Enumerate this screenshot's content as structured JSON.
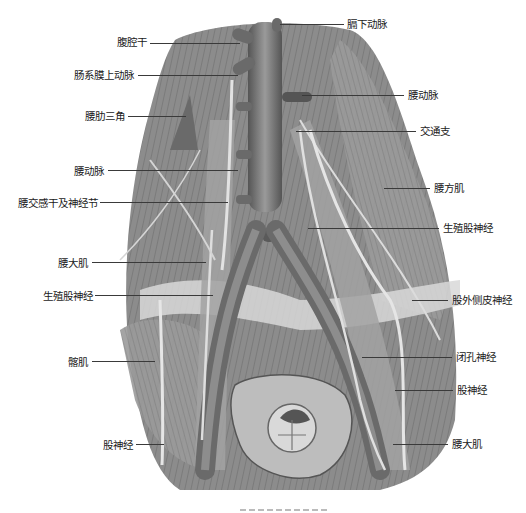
{
  "figure": {
    "type": "anatomical-illustration",
    "style": "grayscale pencil drawing",
    "colors": {
      "background": "#ffffff",
      "muscle": "#8a8a8a",
      "vessel": "#6e6e6e",
      "nerve": "#d8d8d8",
      "text": "#1a1a1a"
    }
  },
  "labels": {
    "left": [
      {
        "id": "celiac-trunk",
        "text": "腹腔干"
      },
      {
        "id": "superior-mesenteric-artery",
        "text": "肠系膜上动脉"
      },
      {
        "id": "lumbocostal-triangle",
        "text": "腰肋三角"
      },
      {
        "id": "lumbar-artery",
        "text": "腰动脉"
      },
      {
        "id": "lumbar-sympathetic-trunk",
        "text": "腰交感干及神经节"
      },
      {
        "id": "psoas-major-left",
        "text": "腰大肌"
      },
      {
        "id": "genitofemoral-nerve-left",
        "text": "生殖股神经"
      },
      {
        "id": "iliacus",
        "text": "髂肌"
      },
      {
        "id": "femoral-nerve-left",
        "text": "股神经"
      }
    ],
    "right": [
      {
        "id": "inferior-phrenic-artery",
        "text": "膈下动脉"
      },
      {
        "id": "lumbar-artery-right",
        "text": "腰动脉"
      },
      {
        "id": "communicating-branch",
        "text": "交通支"
      },
      {
        "id": "quadratus-lumborum",
        "text": "腰方肌"
      },
      {
        "id": "genitofemoral-nerve-right",
        "text": "生殖股神经"
      },
      {
        "id": "lateral-femoral-cutaneous-nerve",
        "text": "股外侧皮神经"
      },
      {
        "id": "obturator-nerve",
        "text": "闭孔神经"
      },
      {
        "id": "femoral-nerve-right",
        "text": "股神经"
      },
      {
        "id": "psoas-major-right",
        "text": "腰大肌"
      }
    ]
  }
}
